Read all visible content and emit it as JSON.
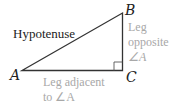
{
  "diagram": {
    "type": "right-triangle",
    "vertices": {
      "A": {
        "label": "A",
        "x": 22,
        "y": 70
      },
      "B": {
        "label": "B",
        "x": 122,
        "y": 13
      },
      "C": {
        "label": "C",
        "x": 122,
        "y": 70
      }
    },
    "labels": {
      "hypotenuse": "Hypotenuse",
      "opposite_line1": "Leg",
      "opposite_line2": "opposite",
      "opposite_line3": "∠A",
      "adjacent_line1": "Leg adjacent",
      "adjacent_line2": "to ∠A"
    },
    "colors": {
      "lines": "#333333",
      "text": "#222222",
      "leg_text": "#a8a8a8"
    }
  }
}
